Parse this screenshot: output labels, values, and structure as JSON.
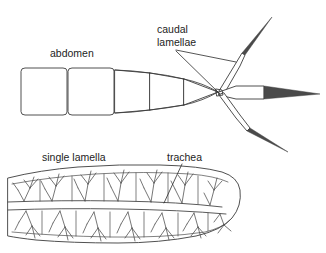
{
  "figure": {
    "background_color": "#ffffff",
    "line_color": "#3c3c3c",
    "text_color": "#1d1d1d"
  },
  "labels": {
    "abdomen": "abdomen",
    "caudal_line1": "caudal",
    "caudal_line2": "lamellae",
    "single_lamella": "single lamella",
    "trachea": "trachea"
  },
  "upper_diagram": {
    "name": "abdomen-with-caudal-lamellae",
    "segment_count": 5,
    "lamellae_count": 3,
    "lamellae_names": [
      "upper-caudal-lamella",
      "median-caudal-lamella",
      "lower-caudal-lamella"
    ]
  },
  "lower_diagram": {
    "name": "single-lamella-detail",
    "chambers": 2,
    "feature": "tracheal branching"
  }
}
